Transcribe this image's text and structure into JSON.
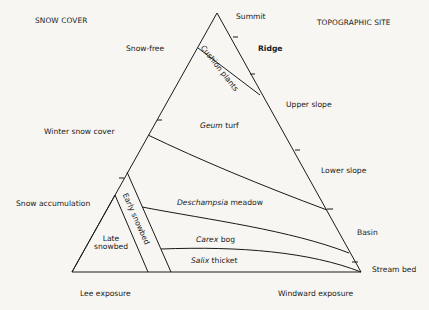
{
  "diagram": {
    "axes": {
      "snow_cover_title": "SNOW COVER",
      "topographic_site_title": "TOPOGRAPHIC SITE"
    },
    "snow_cover_labels": [
      "Snow-free",
      "Winter snow cover",
      "Snow accumulation"
    ],
    "topographic_labels": [
      "Summit",
      "Ridge",
      "Upper slope",
      "Lower slope",
      "Basin",
      "Stream bed"
    ],
    "exposure_labels": {
      "lee": "Lee exposure",
      "windward": "Windward exposure"
    },
    "zones": {
      "cushion_plants": "Cushion plants",
      "geum_genus": "Geum",
      "geum_rest": " turf",
      "deschampsia_genus": "Deschampsia",
      "deschampsia_rest": " meadow",
      "carex_genus": "Carex",
      "carex_rest": " bog",
      "salix_genus": "Salix",
      "salix_rest": " thicket",
      "early_snowbed": "Early snowbed",
      "late_snowbed_line1": "Late",
      "late_snowbed_line2": "snowbed"
    },
    "colors": {
      "line": "#1a1a1a",
      "background": "#f7f6f2"
    }
  }
}
